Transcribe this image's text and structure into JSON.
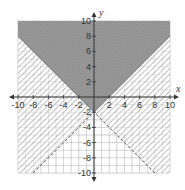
{
  "chart_data": {
    "type": "inequality-region",
    "title": "",
    "xlabel": "x",
    "ylabel": "y",
    "xlim": [
      -10,
      10
    ],
    "ylim": [
      -10,
      10
    ],
    "grid": true,
    "grid_step": 1,
    "x_ticks": [
      -10,
      -8,
      -6,
      -4,
      -2,
      2,
      4,
      6,
      8,
      10
    ],
    "y_ticks": [
      -10,
      -8,
      -6,
      -4,
      -2,
      2,
      4,
      6,
      8,
      10
    ],
    "x_tick_labels": [
      "-10",
      "-8",
      "-6",
      "-4",
      "-2",
      "2",
      "4",
      "6",
      "8",
      "10"
    ],
    "y_tick_labels": [
      "-10",
      "-8",
      "-6",
      "-4",
      "-2",
      "2",
      "4",
      "6",
      "8",
      "10"
    ],
    "inequalities": [
      {
        "name": "upper-region",
        "expression": "y >= |x| - 2",
        "boundary": {
          "vertex": [
            0,
            -2
          ],
          "slopes": [
            -1,
            1
          ],
          "style": "solid"
        },
        "shading": "dark-crosshatch",
        "side": "above"
      },
      {
        "name": "hatched-region",
        "expression": "y > -|x| - 2",
        "boundary": {
          "vertex": [
            0,
            -2
          ],
          "slopes": [
            1,
            -1
          ],
          "style": "dashed"
        },
        "shading": "diagonal-hatch",
        "side": "above"
      }
    ],
    "colors": {
      "dark_fill": "#8a8a8a",
      "hatch": "#b0b0b0",
      "grid": "#c8c8c8",
      "axis": "#333333"
    }
  }
}
